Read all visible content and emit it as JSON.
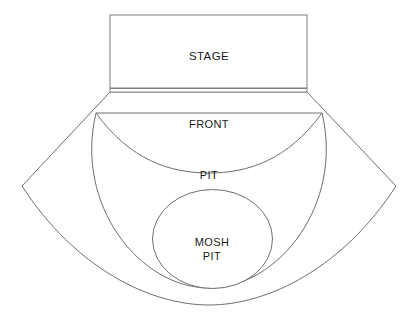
{
  "diagram": {
    "background_color": "#ffffff",
    "line_color": "#6e6e6e",
    "text_color": "#1a1a1a"
  },
  "zones": {
    "stage": {
      "label": "STAGE",
      "shape": "rectangle"
    },
    "barrier": {
      "label": "",
      "shape": "thin-strip"
    },
    "front": {
      "label": "FRONT",
      "shape": "fan-section"
    },
    "pit": {
      "label": "PIT",
      "shape": "fan-section"
    },
    "mosh_pit": {
      "label_line_1": "MOSH",
      "label_line_2": "PIT",
      "shape": "circle"
    },
    "general": {
      "label": "",
      "shape": "fan-section"
    }
  }
}
